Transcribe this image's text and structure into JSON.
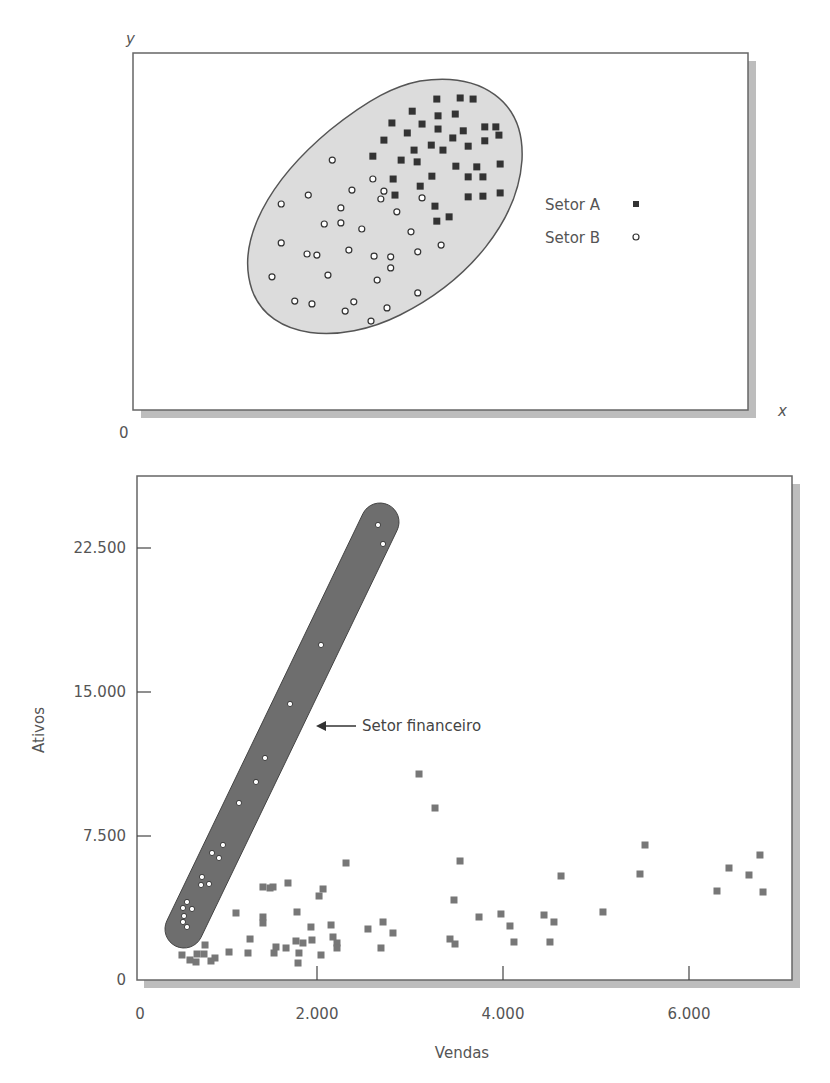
{
  "chart_data": [
    {
      "type": "scatter",
      "title": "",
      "xlabel": "x",
      "ylabel": "y",
      "origin_label": "0",
      "axis_units": "unitless (relative position within plot, 0-100)",
      "xlim": [
        0,
        100
      ],
      "ylim": [
        0,
        100
      ],
      "grid": false,
      "legend_position": "right",
      "enclosure": "shaded ellipse around all points",
      "series": [
        {
          "name": "Setor A",
          "marker": "filled-square",
          "color": "#333333",
          "points": [
            [
              49.4,
              87.1
            ],
            [
              53.2,
              87.4
            ],
            [
              55.3,
              87.1
            ],
            [
              45.4,
              83.7
            ],
            [
              49.6,
              82.4
            ],
            [
              52.4,
              82.9
            ],
            [
              42.1,
              80.4
            ],
            [
              47.0,
              80.1
            ],
            [
              49.6,
              78.7
            ],
            [
              57.2,
              79.3
            ],
            [
              59.0,
              79.3
            ],
            [
              44.6,
              77.6
            ],
            [
              53.7,
              78.2
            ],
            [
              52.0,
              76.2
            ],
            [
              40.8,
              75.6
            ],
            [
              57.2,
              75.4
            ],
            [
              59.5,
              77.0
            ],
            [
              48.5,
              74.2
            ],
            [
              54.5,
              73.9
            ],
            [
              45.7,
              72.8
            ],
            [
              50.4,
              72.8
            ],
            [
              39.0,
              71.1
            ],
            [
              43.6,
              70.0
            ],
            [
              46.2,
              69.5
            ],
            [
              52.5,
              68.3
            ],
            [
              55.9,
              68.1
            ],
            [
              59.7,
              68.9
            ],
            [
              48.6,
              65.5
            ],
            [
              54.5,
              65.3
            ],
            [
              56.9,
              65.3
            ],
            [
              42.3,
              64.7
            ],
            [
              46.7,
              62.7
            ],
            [
              42.6,
              60.2
            ],
            [
              54.5,
              59.7
            ],
            [
              56.9,
              59.9
            ],
            [
              59.7,
              60.8
            ],
            [
              49.1,
              57.1
            ],
            [
              49.4,
              52.9
            ],
            [
              51.4,
              54.1
            ]
          ]
        },
        {
          "name": "Setor B",
          "marker": "open-circle",
          "color": "#333333",
          "points": [
            [
              32.4,
              70.0
            ],
            [
              39.0,
              64.7
            ],
            [
              35.6,
              61.6
            ],
            [
              40.8,
              61.3
            ],
            [
              40.3,
              59.1
            ],
            [
              47.0,
              59.4
            ],
            [
              28.5,
              60.2
            ],
            [
              24.1,
              57.7
            ],
            [
              33.8,
              56.6
            ],
            [
              42.9,
              55.5
            ],
            [
              31.1,
              52.1
            ],
            [
              33.8,
              52.4
            ],
            [
              37.2,
              50.7
            ],
            [
              45.2,
              49.9
            ],
            [
              24.1,
              46.8
            ],
            [
              50.1,
              46.2
            ],
            [
              28.3,
              43.7
            ],
            [
              29.9,
              43.4
            ],
            [
              35.1,
              44.8
            ],
            [
              39.2,
              43.1
            ],
            [
              41.9,
              42.9
            ],
            [
              46.3,
              44.3
            ],
            [
              41.9,
              39.8
            ],
            [
              22.6,
              37.3
            ],
            [
              31.7,
              37.8
            ],
            [
              39.7,
              36.4
            ],
            [
              46.3,
              32.8
            ],
            [
              26.3,
              30.5
            ],
            [
              29.1,
              29.7
            ],
            [
              35.9,
              30.3
            ],
            [
              34.5,
              27.7
            ],
            [
              41.3,
              28.6
            ],
            [
              38.7,
              24.9
            ]
          ]
        }
      ]
    },
    {
      "type": "scatter",
      "title": "",
      "xlabel": "Vendas",
      "ylabel": "Ativos",
      "xlim": [
        0,
        7100
      ],
      "ylim": [
        0,
        26250
      ],
      "xticks": [
        0,
        2000,
        4000,
        6000
      ],
      "xtick_labels": [
        "0",
        "2.000",
        "4.000",
        "6.000"
      ],
      "yticks": [
        0,
        7500,
        15000,
        22500
      ],
      "ytick_labels": [
        "0",
        "7.500",
        "15.000",
        "22.500"
      ],
      "grid": false,
      "annotation": {
        "text": "Setor financeiro",
        "arrow": "left",
        "points_to": "shaded band enclosing financial-sector points"
      },
      "series": [
        {
          "name": "Setor financeiro",
          "marker": "open-circle",
          "color": "#ffffff",
          "band_color": "#6e6e6e",
          "points": [
            [
              2656,
              23698
            ],
            [
              2710,
              22708
            ],
            [
              2043,
              17448
            ],
            [
              1710,
              14375
            ],
            [
              1441,
              11563
            ],
            [
              1344,
              10313
            ],
            [
              1161,
              9219
            ],
            [
              989,
              7031
            ],
            [
              871,
              6615
            ],
            [
              946,
              6354
            ],
            [
              763,
              5365
            ],
            [
              753,
              4948
            ],
            [
              839,
              5000
            ],
            [
              602,
              4063
            ],
            [
              559,
              3750
            ],
            [
              656,
              3698
            ],
            [
              570,
              3333
            ],
            [
              559,
              3021
            ],
            [
              602,
              2760
            ]
          ]
        },
        {
          "name": "Outros setores",
          "marker": "filled-square",
          "color": "#777777",
          "points": [
            [
              2312,
              6094
            ],
            [
              1419,
              4844
            ],
            [
              1495,
              4792
            ],
            [
              1527,
              4844
            ],
            [
              1688,
              5052
            ],
            [
              2065,
              4740
            ],
            [
              2022,
              4375
            ],
            [
              1129,
              3490
            ],
            [
              1785,
              3542
            ],
            [
              1419,
              3281
            ],
            [
              1419,
              2969
            ],
            [
              1935,
              2760
            ],
            [
              2151,
              2865
            ],
            [
              2548,
              2656
            ],
            [
              2710,
              3021
            ],
            [
              2817,
              2448
            ],
            [
              1280,
              2135
            ],
            [
              2172,
              2240
            ],
            [
              1946,
              2083
            ],
            [
              1849,
              1927
            ],
            [
              1774,
              2031
            ],
            [
              2215,
              1927
            ],
            [
              2215,
              1667
            ],
            [
              796,
              1823
            ],
            [
              1559,
              1719
            ],
            [
              1667,
              1667
            ],
            [
              2688,
              1667
            ],
            [
              548,
              1302
            ],
            [
              710,
              1354
            ],
            [
              785,
              1354
            ],
            [
              1054,
              1458
            ],
            [
              1258,
              1406
            ],
            [
              1538,
              1406
            ],
            [
              1806,
              1406
            ],
            [
              2043,
              1302
            ],
            [
              634,
              1042
            ],
            [
              699,
              938
            ],
            [
              860,
              990
            ],
            [
              903,
              1146
            ],
            [
              1796,
              885
            ],
            [
              3097,
              10729
            ],
            [
              3269,
              8958
            ],
            [
              3538,
              6198
            ],
            [
              3473,
              4167
            ],
            [
              3742,
              3281
            ],
            [
              3978,
              3438
            ],
            [
              4075,
              2813
            ],
            [
              3430,
              2135
            ],
            [
              3484,
              1875
            ],
            [
              4118,
              1979
            ],
            [
              4441,
              3385
            ],
            [
              4548,
              3021
            ],
            [
              4505,
              1979
            ],
            [
              4624,
              5417
            ],
            [
              5075,
              3542
            ],
            [
              5473,
              5521
            ],
            [
              5527,
              7031
            ],
            [
              6301,
              4635
            ],
            [
              6430,
              5833
            ],
            [
              6645,
              5469
            ],
            [
              6763,
              6510
            ],
            [
              6796,
              4583
            ]
          ]
        }
      ]
    }
  ]
}
